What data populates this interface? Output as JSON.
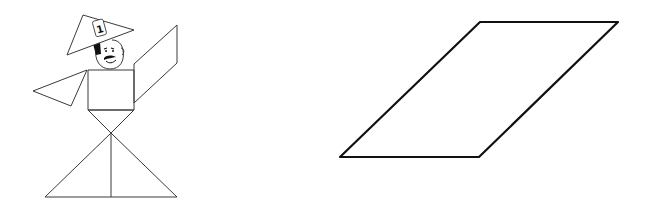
{
  "figures": {
    "person": {
      "label": "tangram-person-figure",
      "hat": {
        "points": [
          [
            67,
            55
          ],
          [
            83,
            15
          ],
          [
            134,
            30
          ]
        ],
        "badge_text": "1"
      },
      "face": {
        "cx": 109,
        "cy": 52,
        "r": 15
      },
      "body_square": {
        "x": 88,
        "y": 70,
        "width": 46,
        "height": 40
      },
      "left_arm": {
        "points": [
          [
            33,
            91
          ],
          [
            87,
            70
          ],
          [
            71,
            106
          ]
        ]
      },
      "right_arm": {
        "points": [
          [
            134,
            64
          ],
          [
            177,
            25
          ],
          [
            177,
            63
          ],
          [
            134,
            103
          ]
        ]
      },
      "waist_triangle": {
        "points": [
          [
            88,
            110
          ],
          [
            134,
            110
          ],
          [
            111,
            133
          ]
        ]
      },
      "legs_triangle": {
        "points": [
          [
            111,
            133
          ],
          [
            45,
            197
          ],
          [
            177,
            197
          ]
        ],
        "divider_x": 111
      }
    },
    "parallelogram": {
      "label": "parallelogram-shape",
      "points": [
        [
          480,
          22
        ],
        [
          618,
          22
        ],
        [
          479,
          157
        ],
        [
          340,
          157
        ]
      ]
    }
  },
  "colors": {
    "stroke": "#111111",
    "thin_stroke": "#3a3a3a",
    "background": "#ffffff"
  }
}
